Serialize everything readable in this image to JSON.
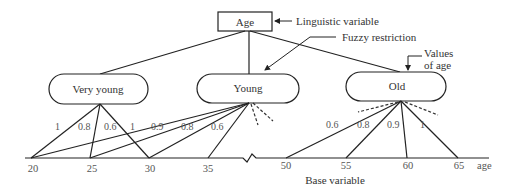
{
  "root": {
    "label": "Age"
  },
  "annotations": {
    "linguistic_variable": "Linguistic variable",
    "fuzzy_restriction": "Fuzzy restriction",
    "values_of_age_line1": "Values",
    "values_of_age_line2": "of age",
    "base_variable": "Base variable",
    "axis_unit": "age"
  },
  "terms": [
    {
      "label": "Very young"
    },
    {
      "label": "Young"
    },
    {
      "label": "Old"
    }
  ],
  "axis_ticks": [
    "20",
    "25",
    "30",
    "35",
    "50",
    "55",
    "60",
    "65"
  ],
  "memberships": {
    "very_young": [
      {
        "age": "20",
        "degree": "1"
      },
      {
        "age": "25",
        "degree": "0.8"
      },
      {
        "age": "30",
        "degree": "0.6"
      }
    ],
    "young": [
      {
        "age": "20",
        "degree": "1"
      },
      {
        "age": "25",
        "degree": "0.9"
      },
      {
        "age": "30",
        "degree": "0.8"
      },
      {
        "age": "35",
        "degree": "0.6"
      }
    ],
    "old": [
      {
        "age": "50",
        "degree": "0.6"
      },
      {
        "age": "55",
        "degree": "0.8"
      },
      {
        "age": "60",
        "degree": "0.9"
      },
      {
        "age": "65",
        "degree": "1"
      }
    ]
  },
  "degree_labels": [
    "1",
    "0.8",
    "0.6",
    "1",
    "0.9",
    "0.8",
    "0.6",
    "0.6",
    "0.8",
    "0.9",
    "1"
  ]
}
